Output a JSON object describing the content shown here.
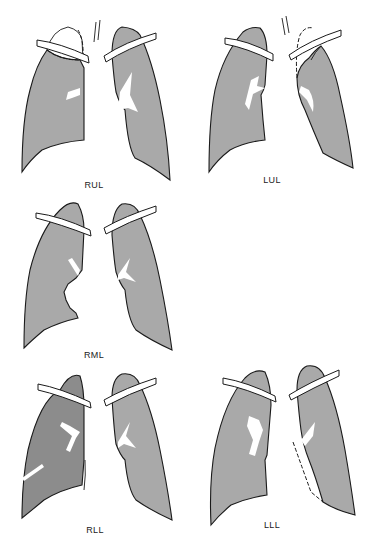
{
  "figure": {
    "colors": {
      "normal_lung": "#a9a9a9",
      "dense_lung": "#8c8c8c",
      "background": "#ffffff",
      "outline": "#1a1a1a"
    }
  },
  "panels": [
    {
      "id": "rul",
      "label": "RUL",
      "name": "Right upper lobe collapse"
    },
    {
      "id": "lul",
      "label": "LUL",
      "name": "Left upper lobe collapse"
    },
    {
      "id": "rml",
      "label": "RML",
      "name": "Right middle lobe collapse"
    },
    {
      "id": "rll",
      "label": "RLL",
      "name": "Right lower lobe collapse"
    },
    {
      "id": "lll",
      "label": "LLL",
      "name": "Left lower lobe collapse"
    }
  ]
}
